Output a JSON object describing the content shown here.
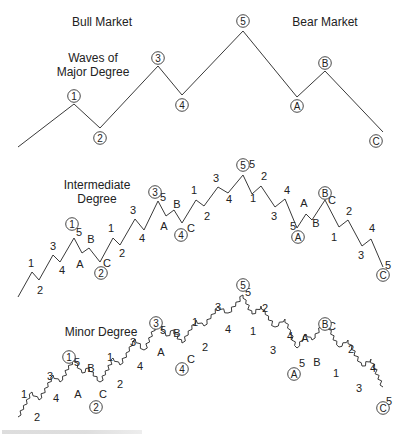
{
  "diagram": {
    "title_left": "Bull Market",
    "title_right": "Bear Market",
    "major": {
      "label_line1": "Waves of",
      "label_line2": "Major Degree",
      "points": [
        [
          18,
          147
        ],
        [
          74,
          104
        ],
        [
          100,
          128
        ],
        [
          158,
          66
        ],
        [
          182,
          95
        ],
        [
          243,
          31
        ],
        [
          297,
          97
        ],
        [
          325,
          71
        ],
        [
          383,
          132
        ]
      ],
      "circled_labels": [
        {
          "text": "1",
          "x": 74,
          "y": 96
        },
        {
          "text": "2",
          "x": 100,
          "y": 138
        },
        {
          "text": "3",
          "x": 158,
          "y": 58
        },
        {
          "text": "4",
          "x": 182,
          "y": 105
        },
        {
          "text": "5",
          "x": 243,
          "y": 21
        },
        {
          "text": "A",
          "x": 297,
          "y": 106
        },
        {
          "text": "B",
          "x": 325,
          "y": 63
        },
        {
          "text": "C",
          "x": 376,
          "y": 141
        }
      ]
    },
    "intermediate": {
      "label_line1": "Intermediate",
      "label_line2": "Degree",
      "points": [
        [
          18,
          297
        ],
        [
          32,
          272
        ],
        [
          39,
          280
        ],
        [
          53,
          255
        ],
        [
          60,
          262
        ],
        [
          74,
          238
        ],
        [
          82,
          253
        ],
        [
          89,
          248
        ],
        [
          100,
          262
        ],
        [
          113,
          238
        ],
        [
          120,
          245
        ],
        [
          135,
          219
        ],
        [
          144,
          230
        ],
        [
          158,
          201
        ],
        [
          166,
          216
        ],
        [
          174,
          210
        ],
        [
          182,
          223
        ],
        [
          196,
          200
        ],
        [
          204,
          206
        ],
        [
          218,
          187
        ],
        [
          228,
          193
        ],
        [
          243,
          175
        ],
        [
          252,
          194
        ],
        [
          261,
          186
        ],
        [
          275,
          207
        ],
        [
          285,
          199
        ],
        [
          297,
          228
        ],
        [
          306,
          214
        ],
        [
          312,
          220
        ],
        [
          325,
          200
        ],
        [
          339,
          227
        ],
        [
          348,
          220
        ],
        [
          362,
          246
        ],
        [
          371,
          239
        ],
        [
          383,
          267
        ]
      ],
      "labels": [
        {
          "text": "1",
          "x": 31,
          "y": 267
        },
        {
          "text": "2",
          "x": 40,
          "y": 294
        },
        {
          "text": "3",
          "x": 53,
          "y": 250
        },
        {
          "text": "4",
          "x": 62,
          "y": 274
        },
        {
          "text": "5",
          "x": 79,
          "y": 236
        },
        {
          "text": "A",
          "x": 80,
          "y": 268
        },
        {
          "text": "B",
          "x": 91,
          "y": 243
        },
        {
          "text": "C",
          "x": 107,
          "y": 267
        },
        {
          "text": "1",
          "x": 111,
          "y": 232
        },
        {
          "text": "2",
          "x": 122,
          "y": 257
        },
        {
          "text": "3",
          "x": 133,
          "y": 214
        },
        {
          "text": "4",
          "x": 142,
          "y": 242
        },
        {
          "text": "5",
          "x": 163,
          "y": 201
        },
        {
          "text": "A",
          "x": 164,
          "y": 230
        },
        {
          "text": "B",
          "x": 177,
          "y": 208
        },
        {
          "text": "C",
          "x": 191,
          "y": 232
        },
        {
          "text": "1",
          "x": 194,
          "y": 194
        },
        {
          "text": "2",
          "x": 207,
          "y": 220
        },
        {
          "text": "3",
          "x": 216,
          "y": 182
        },
        {
          "text": "4",
          "x": 229,
          "y": 203
        },
        {
          "text": "5",
          "x": 252,
          "y": 168
        },
        {
          "text": "1",
          "x": 253,
          "y": 202
        },
        {
          "text": "2",
          "x": 264,
          "y": 180
        },
        {
          "text": "3",
          "x": 274,
          "y": 220
        },
        {
          "text": "4",
          "x": 287,
          "y": 194
        },
        {
          "text": "5",
          "x": 293,
          "y": 230
        },
        {
          "text": "A",
          "x": 304,
          "y": 207
        },
        {
          "text": "B",
          "x": 316,
          "y": 227
        },
        {
          "text": "C",
          "x": 332,
          "y": 204
        },
        {
          "text": "1",
          "x": 334,
          "y": 241
        },
        {
          "text": "2",
          "x": 349,
          "y": 215
        },
        {
          "text": "3",
          "x": 361,
          "y": 259
        },
        {
          "text": "4",
          "x": 372,
          "y": 232
        },
        {
          "text": "5",
          "x": 388,
          "y": 269
        }
      ],
      "circled_labels": [
        {
          "text": "1",
          "x": 72,
          "y": 224
        },
        {
          "text": "2",
          "x": 101,
          "y": 273
        },
        {
          "text": "3",
          "x": 155,
          "y": 192
        },
        {
          "text": "4",
          "x": 181,
          "y": 235
        },
        {
          "text": "5",
          "x": 243,
          "y": 165
        },
        {
          "text": "A",
          "x": 298,
          "y": 237
        },
        {
          "text": "B",
          "x": 325,
          "y": 193
        },
        {
          "text": "C",
          "x": 383,
          "y": 275
        }
      ]
    },
    "minor": {
      "label": "Minor Degree",
      "circled_labels": [
        {
          "text": "1",
          "x": 69,
          "y": 357
        },
        {
          "text": "2",
          "x": 96,
          "y": 407
        },
        {
          "text": "3",
          "x": 156,
          "y": 323
        },
        {
          "text": "4",
          "x": 182,
          "y": 369
        },
        {
          "text": "5",
          "x": 243,
          "y": 285
        },
        {
          "text": "A",
          "x": 294,
          "y": 374
        },
        {
          "text": "B",
          "x": 325,
          "y": 324
        },
        {
          "text": "C",
          "x": 383,
          "y": 408
        }
      ],
      "labels": [
        {
          "text": "1",
          "x": 24,
          "y": 398
        },
        {
          "text": "2",
          "x": 37,
          "y": 421
        },
        {
          "text": "3",
          "x": 50,
          "y": 380
        },
        {
          "text": "4",
          "x": 56,
          "y": 402
        },
        {
          "text": "5",
          "x": 77,
          "y": 366
        },
        {
          "text": "A",
          "x": 78,
          "y": 398
        },
        {
          "text": "B",
          "x": 91,
          "y": 372
        },
        {
          "text": "C",
          "x": 103,
          "y": 398
        },
        {
          "text": "1",
          "x": 110,
          "y": 361
        },
        {
          "text": "2",
          "x": 120,
          "y": 388
        },
        {
          "text": "3",
          "x": 133,
          "y": 346
        },
        {
          "text": "4",
          "x": 140,
          "y": 370
        },
        {
          "text": "5",
          "x": 163,
          "y": 334
        },
        {
          "text": "A",
          "x": 161,
          "y": 356
        },
        {
          "text": "B",
          "x": 177,
          "y": 337
        },
        {
          "text": "C",
          "x": 191,
          "y": 363
        },
        {
          "text": "1",
          "x": 195,
          "y": 326
        },
        {
          "text": "2",
          "x": 205,
          "y": 351
        },
        {
          "text": "3",
          "x": 218,
          "y": 311
        },
        {
          "text": "4",
          "x": 228,
          "y": 333
        },
        {
          "text": "5",
          "x": 248,
          "y": 296
        },
        {
          "text": "1",
          "x": 253,
          "y": 335
        },
        {
          "text": "2",
          "x": 265,
          "y": 312
        },
        {
          "text": "3",
          "x": 273,
          "y": 354
        },
        {
          "text": "4",
          "x": 290,
          "y": 340
        },
        {
          "text": "5",
          "x": 302,
          "y": 367
        },
        {
          "text": "A",
          "x": 305,
          "y": 342
        },
        {
          "text": "B",
          "x": 317,
          "y": 366
        },
        {
          "text": "C",
          "x": 332,
          "y": 330
        },
        {
          "text": "1",
          "x": 336,
          "y": 377
        },
        {
          "text": "2",
          "x": 351,
          "y": 353
        },
        {
          "text": "3",
          "x": 359,
          "y": 392
        },
        {
          "text": "4",
          "x": 373,
          "y": 372
        },
        {
          "text": "5",
          "x": 389,
          "y": 405
        }
      ]
    },
    "caption_visible": true,
    "line_color": "#3a3a3a",
    "background": "#ffffff"
  }
}
